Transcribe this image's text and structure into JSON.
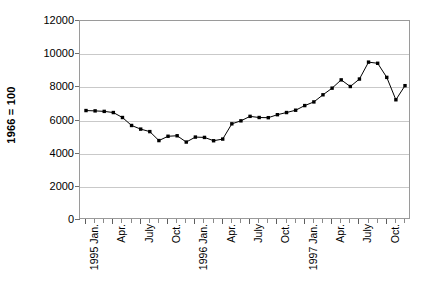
{
  "chart_data": {
    "type": "line",
    "title": "",
    "subtitle": "",
    "xlabel": "",
    "ylabel": "1966 = 100",
    "ylim": [
      0,
      12000
    ],
    "y_ticks": [
      0,
      2000,
      4000,
      6000,
      8000,
      10000,
      12000
    ],
    "y_tick_labels": [
      "0",
      "2000",
      "4000",
      "6000",
      "8000",
      "10000",
      "12000"
    ],
    "grid": true,
    "legend": "none",
    "marker": "filled-square",
    "line_color": "#000000",
    "marker_color": "#000000",
    "grid_color": "#c9c9c9",
    "axis_color": "#9a9a9a",
    "x_tick_labels": [
      "1995 Jan.",
      "Apr.",
      "July",
      "Oct.",
      "1996 Jan.",
      "Apr.",
      "July",
      "Oct.",
      "1997 Jan.",
      "Apr.",
      "July",
      "Oct."
    ],
    "x_tick_label_indices": [
      0,
      3,
      6,
      9,
      12,
      15,
      18,
      21,
      24,
      27,
      30,
      33
    ],
    "x": [
      "1995 Jan.",
      "1995 Feb.",
      "1995 Mar.",
      "1995 Apr.",
      "1995 May",
      "1995 June",
      "1995 July",
      "1995 Aug.",
      "1995 Sept.",
      "1995 Oct.",
      "1995 Nov.",
      "1995 Dec.",
      "1996 Jan.",
      "1996 Feb.",
      "1996 Mar.",
      "1996 Apr.",
      "1996 May",
      "1996 June",
      "1996 July",
      "1996 Aug.",
      "1996 Sept.",
      "1996 Oct.",
      "1996 Nov.",
      "1996 Dec.",
      "1997 Jan.",
      "1997 Feb.",
      "1997 Mar.",
      "1997 Apr.",
      "1997 May",
      "1997 June",
      "1997 July",
      "1997 Aug.",
      "1997 Sept.",
      "1997 Oct.",
      "1997 Nov.",
      "1997 Dec."
    ],
    "values": [
      6600,
      6580,
      6550,
      6480,
      6180,
      5700,
      5480,
      5330,
      4790,
      5050,
      5080,
      4700,
      5000,
      4980,
      4780,
      4880,
      5800,
      5980,
      6250,
      6180,
      6170,
      6350,
      6480,
      6620,
      6900,
      7120,
      7550,
      7950,
      8450,
      8050,
      8500,
      9520,
      9450,
      8600,
      7250,
      8100
    ],
    "series": [
      {
        "name": "Index (1966 = 100)",
        "values": [
          6600,
          6580,
          6550,
          6480,
          6180,
          5700,
          5480,
          5330,
          4790,
          5050,
          5080,
          4700,
          5000,
          4980,
          4780,
          4880,
          5800,
          5980,
          6250,
          6180,
          6170,
          6350,
          6480,
          6620,
          6900,
          7120,
          7550,
          7950,
          8450,
          8050,
          8500,
          9520,
          9450,
          8600,
          7250,
          8100
        ]
      }
    ]
  }
}
